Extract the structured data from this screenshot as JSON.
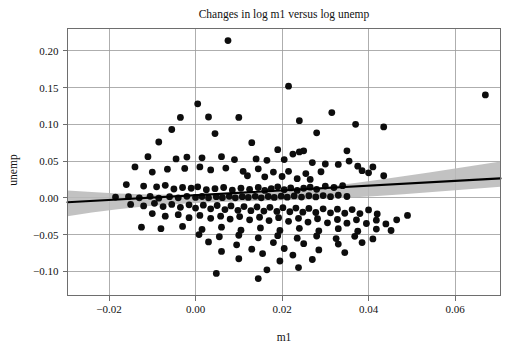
{
  "chart_data": {
    "type": "scatter",
    "title": "Changes in log m1 versus log unemp",
    "xlabel": "m1",
    "ylabel": "unemp",
    "grid": true,
    "legend": null,
    "xlim": [
      -0.0296,
      0.0705
    ],
    "ylim": [
      -0.133,
      0.2305
    ],
    "xticks": [
      -0.02,
      0.0,
      0.02,
      0.04,
      0.06
    ],
    "xticklabels": [
      "−0.02",
      "0.00",
      "0.02",
      "0.04",
      "0.06"
    ],
    "yticks": [
      0.2,
      0.15,
      0.1,
      0.05,
      0.0,
      -0.05,
      -0.1
    ],
    "yticklabels": [
      "0.20",
      "0.15",
      "0.10",
      "0.05",
      "0.00",
      "−0.05",
      "−0.10"
    ],
    "marker": {
      "shape": "circle",
      "size": 3.4,
      "color": "#0d0d0d"
    },
    "fit_line": {
      "type": "linear-regression",
      "color": "#000000",
      "x": [
        -0.0296,
        0.0705
      ],
      "y": [
        -0.0061,
        0.0265
      ]
    },
    "confidence_band": {
      "color": "#b9b9b9",
      "x": [
        -0.0296,
        -0.024,
        -0.018,
        -0.012,
        -0.006,
        0.0,
        0.006,
        0.012,
        0.018,
        0.024,
        0.03,
        0.036,
        0.042,
        0.048,
        0.054,
        0.06,
        0.066,
        0.0705
      ],
      "upper": [
        0.01,
        0.0078,
        0.006,
        0.0048,
        0.0041,
        0.004,
        0.0046,
        0.0059,
        0.0081,
        0.0113,
        0.0152,
        0.0196,
        0.0244,
        0.0294,
        0.0346,
        0.04,
        0.0454,
        0.0495
      ],
      "lower": [
        -0.025,
        -0.02,
        -0.0155,
        -0.0118,
        -0.009,
        -0.007,
        -0.0056,
        -0.0046,
        -0.0038,
        -0.0027,
        -0.0013,
        0.0005,
        0.0026,
        0.005,
        0.0076,
        0.0103,
        0.0131,
        0.0152
      ]
    },
    "points": [
      [
        0.0075,
        0.214
      ],
      [
        0.0215,
        0.152
      ],
      [
        0.0005,
        0.128
      ],
      [
        0.0315,
        0.116
      ],
      [
        0.067,
        0.14
      ],
      [
        0.037,
        0.1
      ],
      [
        0.024,
        0.105
      ],
      [
        -0.0035,
        0.1095
      ],
      [
        0.003,
        0.11
      ],
      [
        0.01,
        0.1095
      ],
      [
        0.0435,
        0.0965
      ],
      [
        -0.0055,
        0.093
      ],
      [
        0.0045,
        0.0875
      ],
      [
        0.028,
        0.0885
      ],
      [
        -0.0085,
        0.076
      ],
      [
        0.013,
        0.075
      ],
      [
        0.019,
        0.0655
      ],
      [
        0.025,
        0.064
      ],
      [
        0.035,
        0.064
      ],
      [
        0.024,
        0.0625
      ],
      [
        0.0225,
        0.0595
      ],
      [
        -0.011,
        0.056
      ],
      [
        -0.0045,
        0.053
      ],
      [
        -0.002,
        0.0555
      ],
      [
        0.0015,
        0.0545
      ],
      [
        0.006,
        0.056
      ],
      [
        0.009,
        0.052
      ],
      [
        0.014,
        0.053
      ],
      [
        0.0165,
        0.051
      ],
      [
        0.0205,
        0.052
      ],
      [
        0.027,
        0.048
      ],
      [
        0.03,
        0.046
      ],
      [
        0.033,
        0.0455
      ],
      [
        0.0355,
        0.05
      ],
      [
        0.0375,
        0.043
      ],
      [
        0.041,
        0.042
      ],
      [
        0.04,
        0.034
      ],
      [
        0.0385,
        0.037
      ],
      [
        0.0435,
        0.03
      ],
      [
        -0.014,
        0.042
      ],
      [
        -0.01,
        0.035
      ],
      [
        -0.0065,
        0.039
      ],
      [
        -0.0025,
        0.04
      ],
      [
        0.001,
        0.042
      ],
      [
        0.0035,
        0.038
      ],
      [
        0.007,
        0.0405
      ],
      [
        0.011,
        0.036
      ],
      [
        0.0145,
        0.0395
      ],
      [
        0.018,
        0.035
      ],
      [
        0.0215,
        0.036
      ],
      [
        0.0255,
        0.033
      ],
      [
        0.029,
        0.0355
      ],
      [
        0.012,
        0.03
      ],
      [
        0.016,
        0.0285
      ],
      [
        0.02,
        0.029
      ],
      [
        0.0235,
        0.026
      ],
      [
        0.0265,
        0.025
      ],
      [
        -0.016,
        0.018
      ],
      [
        -0.012,
        0.016
      ],
      [
        -0.009,
        0.015
      ],
      [
        -0.007,
        0.017
      ],
      [
        -0.005,
        0.012
      ],
      [
        -0.003,
        0.014
      ],
      [
        -0.001,
        0.013
      ],
      [
        0.0005,
        0.015
      ],
      [
        0.0025,
        0.011
      ],
      [
        0.0045,
        0.0125
      ],
      [
        0.0065,
        0.014
      ],
      [
        0.0085,
        0.0105
      ],
      [
        0.0105,
        0.013
      ],
      [
        0.0125,
        0.0115
      ],
      [
        0.0145,
        0.014
      ],
      [
        0.016,
        0.01
      ],
      [
        0.0175,
        0.0125
      ],
      [
        0.019,
        0.015
      ],
      [
        0.0205,
        0.011
      ],
      [
        0.022,
        0.0135
      ],
      [
        0.0235,
        0.01
      ],
      [
        0.025,
        0.013
      ],
      [
        0.0265,
        0.0145
      ],
      [
        0.028,
        0.0115
      ],
      [
        0.03,
        0.016
      ],
      [
        0.032,
        0.014
      ],
      [
        0.034,
        0.0165
      ],
      [
        -0.0185,
        0.001
      ],
      [
        -0.0155,
        0.0015
      ],
      [
        -0.013,
        0.0
      ],
      [
        -0.0105,
        0.002
      ],
      [
        -0.0085,
        -0.0005
      ],
      [
        -0.006,
        0.0015
      ],
      [
        -0.004,
        0.0
      ],
      [
        -0.002,
        0.002
      ],
      [
        0.0,
        0.0005
      ],
      [
        0.0015,
        0.0018
      ],
      [
        0.003,
        0.0
      ],
      [
        0.0048,
        0.0015
      ],
      [
        0.0062,
        0.0002
      ],
      [
        0.0078,
        0.002
      ],
      [
        0.0092,
        0.0
      ],
      [
        0.0108,
        0.0015
      ],
      [
        0.0122,
        0.0005
      ],
      [
        0.0138,
        0.002
      ],
      [
        0.0152,
        0.0
      ],
      [
        0.0168,
        0.0018
      ],
      [
        0.0182,
        0.0005
      ],
      [
        0.0198,
        0.0022
      ],
      [
        0.0212,
        0.0008
      ],
      [
        0.0228,
        0.0025
      ],
      [
        0.0245,
        0.001
      ],
      [
        0.0262,
        0.0028
      ],
      [
        0.0278,
        0.0012
      ],
      [
        0.0295,
        0.003
      ],
      [
        0.0312,
        0.0015
      ],
      [
        0.033,
        0.0035
      ],
      [
        0.035,
        0.0018
      ],
      [
        -0.015,
        -0.009
      ],
      [
        -0.012,
        -0.011
      ],
      [
        -0.0095,
        -0.0075
      ],
      [
        -0.0075,
        -0.012
      ],
      [
        -0.0055,
        -0.009
      ],
      [
        -0.0035,
        -0.013
      ],
      [
        -0.0015,
        -0.0095
      ],
      [
        0.0,
        -0.014
      ],
      [
        0.0018,
        -0.01
      ],
      [
        0.0035,
        -0.015
      ],
      [
        0.005,
        -0.0105
      ],
      [
        0.0068,
        -0.016
      ],
      [
        0.0082,
        -0.011
      ],
      [
        0.0098,
        -0.017
      ],
      [
        0.0112,
        -0.012
      ],
      [
        0.0128,
        -0.0175
      ],
      [
        0.0142,
        -0.0125
      ],
      [
        0.0158,
        -0.018
      ],
      [
        0.0172,
        -0.013
      ],
      [
        0.0188,
        -0.0185
      ],
      [
        0.0202,
        -0.0135
      ],
      [
        0.0218,
        -0.019
      ],
      [
        0.0232,
        -0.014
      ],
      [
        0.0248,
        -0.0195
      ],
      [
        0.0262,
        -0.0145
      ],
      [
        0.0278,
        -0.02
      ],
      [
        0.0295,
        -0.015
      ],
      [
        0.0312,
        -0.0205
      ],
      [
        0.0328,
        -0.0155
      ],
      [
        0.0345,
        -0.021
      ],
      [
        0.0362,
        -0.016
      ],
      [
        0.038,
        -0.0215
      ],
      [
        0.04,
        -0.0165
      ],
      [
        0.042,
        -0.022
      ],
      [
        -0.01,
        -0.0215
      ],
      [
        -0.007,
        -0.025
      ],
      [
        -0.004,
        -0.023
      ],
      [
        -0.0015,
        -0.027
      ],
      [
        0.001,
        -0.024
      ],
      [
        0.0035,
        -0.028
      ],
      [
        0.0058,
        -0.025
      ],
      [
        0.008,
        -0.029
      ],
      [
        0.0102,
        -0.0255
      ],
      [
        0.0125,
        -0.03
      ],
      [
        0.0148,
        -0.0265
      ],
      [
        0.017,
        -0.031
      ],
      [
        0.0192,
        -0.027
      ],
      [
        0.0215,
        -0.032
      ],
      [
        0.0238,
        -0.028
      ],
      [
        0.026,
        -0.033
      ],
      [
        0.0282,
        -0.0285
      ],
      [
        0.0305,
        -0.034
      ],
      [
        0.0328,
        -0.0295
      ],
      [
        0.035,
        -0.0345
      ],
      [
        0.0372,
        -0.03
      ],
      [
        0.0395,
        -0.035
      ],
      [
        0.0418,
        -0.0305
      ],
      [
        0.044,
        -0.0355
      ],
      [
        0.0465,
        -0.03
      ],
      [
        -0.0125,
        -0.04
      ],
      [
        -0.008,
        -0.042
      ],
      [
        -0.003,
        -0.039
      ],
      [
        0.0015,
        -0.043
      ],
      [
        0.006,
        -0.04
      ],
      [
        0.0105,
        -0.044
      ],
      [
        0.015,
        -0.041
      ],
      [
        0.0195,
        -0.0445
      ],
      [
        0.024,
        -0.0415
      ],
      [
        0.0285,
        -0.045
      ],
      [
        0.033,
        -0.042
      ],
      [
        0.0375,
        -0.0455
      ],
      [
        0.0418,
        -0.0425
      ],
      [
        0.0008,
        -0.05
      ],
      [
        0.0055,
        -0.053
      ],
      [
        0.01,
        -0.051
      ],
      [
        0.0145,
        -0.0545
      ],
      [
        0.019,
        -0.0515
      ],
      [
        0.0235,
        -0.055
      ],
      [
        0.028,
        -0.052
      ],
      [
        0.0325,
        -0.0555
      ],
      [
        0.0368,
        -0.0525
      ],
      [
        0.041,
        -0.056
      ],
      [
        0.025,
        -0.0625
      ],
      [
        0.018,
        -0.061
      ],
      [
        0.0095,
        -0.064
      ],
      [
        0.003,
        -0.06
      ],
      [
        0.033,
        -0.063
      ],
      [
        0.0385,
        -0.061
      ],
      [
        0.013,
        -0.07
      ],
      [
        0.0205,
        -0.069
      ],
      [
        0.0285,
        -0.071
      ],
      [
        0.006,
        -0.073
      ],
      [
        0.0155,
        -0.076
      ],
      [
        0.0225,
        -0.078
      ],
      [
        0.0345,
        -0.0745
      ],
      [
        0.01,
        -0.083
      ],
      [
        0.0195,
        -0.086
      ],
      [
        0.027,
        -0.084
      ],
      [
        0.0165,
        -0.098
      ],
      [
        0.0238,
        -0.095
      ],
      [
        0.0048,
        -0.103
      ],
      [
        0.0145,
        -0.11
      ],
      [
        0.0452,
        -0.0445
      ],
      [
        0.049,
        -0.024
      ]
    ]
  }
}
